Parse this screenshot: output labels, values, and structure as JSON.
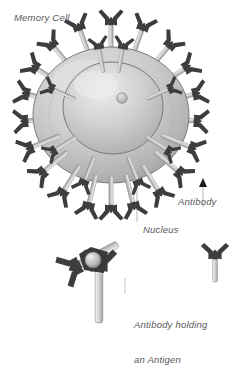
{
  "figure": {
    "title": "Memory Cell",
    "background_color": "#ffffff",
    "labels": {
      "memory_cell": "Memory Cell",
      "antibody": "Antibody",
      "nucleus": "Nucleus",
      "antigen_caption_line1": "Antibody holding",
      "antigen_caption_line2": "an Antigen"
    },
    "colors": {
      "label_text": "#58585a",
      "leader_line": "#b4b4b6",
      "cell_body_light": "#d8d8d8",
      "cell_body_mid": "#bcbcbc",
      "cell_body_dark": "#9a9a9a",
      "cell_outline": "#6e6e6e",
      "nucleus_light": "#e2e2e2",
      "nucleus_mid": "#c4c4c4",
      "nucleus_outline": "#707070",
      "nucleolus": "#bfbfbf",
      "antibody_stem_light": "#e8e8e8",
      "antibody_stem_mid": "#c9c9c9",
      "antibody_stem_dark": "#9d9d9d",
      "antibody_arm_dark": "#3d3d3f",
      "antigen_dark": "#3a3a3c",
      "antigen_sphere": "#c9c9c9",
      "arrowhead": "#1a1a1a"
    },
    "parts": {
      "cell": "memory-cell-body",
      "nucleus": "cell-nucleus",
      "nucleolus": "nucleolus-dot",
      "surface_antibodies_count": 26,
      "detail_antibodies_count": 2,
      "reference_antibody_count": 1,
      "antigen_count": 1
    },
    "annotations": [
      {
        "name": "antibody",
        "target": "surface-antibody"
      },
      {
        "name": "nucleus",
        "target": "cell-nucleus"
      }
    ]
  }
}
